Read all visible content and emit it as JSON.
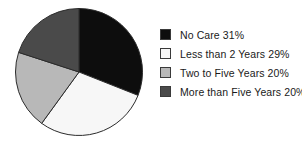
{
  "chart_data": {
    "type": "pie",
    "title": "",
    "categories": [
      "No Care",
      "Less than 2 Years",
      "Two to Five Years",
      "More than Five Years"
    ],
    "values": [
      31,
      29,
      20,
      20
    ],
    "value_suffix": "%",
    "colors": [
      "#0d0d0d",
      "#f7f7f7",
      "#b8b8b8",
      "#4a4a4a"
    ],
    "slice_border_color": "#2b2b2b",
    "start_angle_deg": 0,
    "direction": "clockwise",
    "legend_position": "right",
    "grid": false,
    "legend": [
      {
        "label": "No Care 31%",
        "color": "#0d0d0d",
        "name": "no-care"
      },
      {
        "label": "Less than 2 Years 29%",
        "color": "#f7f7f7",
        "name": "less-than-2-years"
      },
      {
        "label": "Two to Five Years 20%",
        "color": "#b8b8b8",
        "name": "two-to-five-years"
      },
      {
        "label": "More than Five Years 20%",
        "color": "#4a4a4a",
        "name": "more-than-five-years"
      }
    ],
    "slices": [
      {
        "label": "No Care",
        "value": 31,
        "color": "#0d0d0d"
      },
      {
        "label": "Less than 2 Years",
        "value": 29,
        "color": "#f7f7f7"
      },
      {
        "label": "Two to Five Years",
        "value": 20,
        "color": "#b8b8b8"
      },
      {
        "label": "More than Five Years",
        "value": 20,
        "color": "#4a4a4a"
      }
    ]
  }
}
